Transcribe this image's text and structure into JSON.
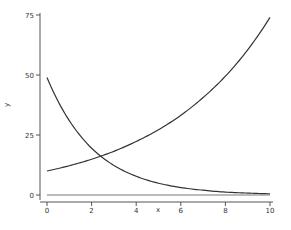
{
  "chart_data": {
    "type": "line",
    "title": "",
    "xlabel": "x",
    "ylabel": "y",
    "xlim": [
      0,
      10
    ],
    "ylim": [
      0,
      75
    ],
    "xticks": [
      0,
      2,
      4,
      6,
      8,
      10
    ],
    "yticks": [
      0,
      25,
      50,
      75
    ],
    "grid": false,
    "legend": null,
    "x": [
      0,
      1,
      2,
      3,
      4,
      5,
      6,
      7,
      8,
      9,
      10
    ],
    "series": [
      {
        "name": "exponential decay",
        "values": [
          49,
          31,
          19.5,
          12.3,
          7.8,
          4.9,
          3.1,
          2.0,
          1.2,
          0.8,
          0.5
        ]
      },
      {
        "name": "exponential growth",
        "values": [
          10,
          12.2,
          14.9,
          18.2,
          22.3,
          27.2,
          33.2,
          40.6,
          49.5,
          60.5,
          74
        ]
      },
      {
        "name": "zero line",
        "values": [
          0,
          0,
          0,
          0,
          0,
          0,
          0,
          0,
          0,
          0,
          0
        ]
      }
    ]
  }
}
